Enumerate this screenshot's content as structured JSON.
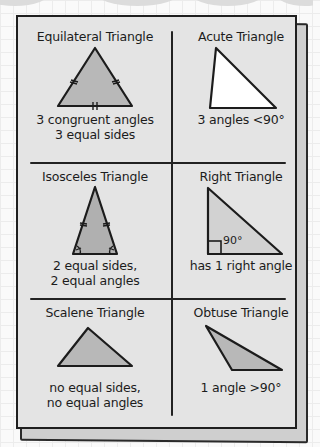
{
  "colors": {
    "sheet": "#e4e4e4",
    "triangle_fill": "#b8b8b8",
    "triangle_fill_light": "#d2d2d2",
    "acute_fill": "#ffffff",
    "ink": "#1c1c1c"
  },
  "cells": [
    {
      "id": "equilateral",
      "title": "Equilateral Triangle",
      "desc_lines": [
        "3 congruent angles",
        "3 equal sides"
      ]
    },
    {
      "id": "acute",
      "title": "Acute Triangle",
      "desc_lines": [
        "3 angles <90°"
      ]
    },
    {
      "id": "isosceles",
      "title": "Isosceles Triangle",
      "desc_lines": [
        "2 equal sides,",
        "2 equal angles"
      ]
    },
    {
      "id": "right",
      "title": "Right Triangle",
      "angle_label": "90°",
      "desc_lines": [
        "has 1 right angle"
      ]
    },
    {
      "id": "scalene",
      "title": "Scalene Triangle",
      "desc_lines": [
        "no equal sides,",
        "no equal angles"
      ]
    },
    {
      "id": "obtuse",
      "title": "Obtuse Triangle",
      "desc_lines": [
        "1 angle >90°"
      ]
    }
  ]
}
